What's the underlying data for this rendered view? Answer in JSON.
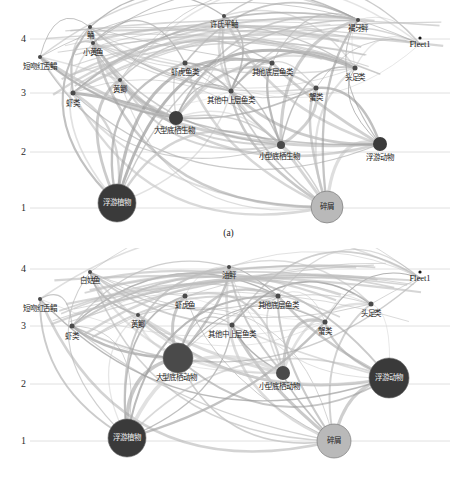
{
  "figure": {
    "type": "network-diagram",
    "panels": [
      {
        "id": "a",
        "caption": "(a)",
        "axis": {
          "label": "",
          "ticks": [
            "4",
            "3",
            "2",
            "1"
          ],
          "tick_y": [
            39,
            93,
            152,
            208
          ],
          "range": [
            1,
            4.6
          ]
        },
        "fleet": {
          "label": "Fleet1",
          "x": 420,
          "y": 44
        },
        "nodes": [
          {
            "name": "浮游植物",
            "x": 117,
            "y": 203,
            "r": 19,
            "color": "#3a3a3a",
            "label_color": "light",
            "trophic": 1.0
          },
          {
            "name": "碎屑",
            "x": 327,
            "y": 207,
            "r": 16,
            "color": "#b9b9b9",
            "label_color": "dark",
            "trophic": 1.0
          },
          {
            "name": "浮游动物",
            "x": 380,
            "y": 144,
            "r": 7,
            "color": "#3b3b3b",
            "label_color": "dark",
            "label_dx": 0,
            "label_dy": 14,
            "trophic": 2.1
          },
          {
            "name": "小型底栖生物",
            "x": 281,
            "y": 145,
            "r": 4,
            "color": "#4a4a4a",
            "label_color": "dark",
            "label_dx": -2,
            "label_dy": 12,
            "trophic": 2.1
          },
          {
            "name": "大型底栖生物",
            "x": 176,
            "y": 118,
            "r": 7,
            "color": "#3f3f3f",
            "label_color": "dark",
            "label_dx": -2,
            "label_dy": 13,
            "trophic": 2.55
          },
          {
            "name": "虾类",
            "x": 73,
            "y": 93,
            "r": 2.5,
            "color": "#4a4a4a",
            "label_color": "dark",
            "label_dx": 0,
            "label_dy": 11,
            "trophic": 3.0
          },
          {
            "name": "其他中上层鱼类",
            "x": 231,
            "y": 91,
            "r": 2.5,
            "color": "#4a4a4a",
            "label_color": "dark",
            "label_dx": 0,
            "label_dy": 10,
            "trophic": 3.02
          },
          {
            "name": "蟹类",
            "x": 316,
            "y": 88,
            "r": 2.5,
            "color": "#4a4a4a",
            "label_color": "dark",
            "label_dx": 0,
            "label_dy": 10,
            "trophic": 3.08
          },
          {
            "name": "黄鲫",
            "x": 120,
            "y": 80,
            "r": 2,
            "color": "#4a4a4a",
            "label_color": "dark",
            "label_dx": 0,
            "label_dy": 10,
            "trophic": 3.25
          },
          {
            "name": "头足类",
            "x": 355,
            "y": 68,
            "r": 2.5,
            "color": "#4a4a4a",
            "label_color": "dark",
            "label_dx": 0,
            "label_dy": 10,
            "trophic": 3.4
          },
          {
            "name": "虾虎鱼类",
            "x": 185,
            "y": 63,
            "r": 2.5,
            "color": "#4a4a4a",
            "label_color": "dark",
            "label_dx": 0,
            "label_dy": 10,
            "trophic": 3.5
          },
          {
            "name": "其他底层鱼类",
            "x": 272,
            "y": 63,
            "r": 2.5,
            "color": "#4a4a4a",
            "label_color": "dark",
            "label_dx": 0,
            "label_dy": 10,
            "trophic": 3.5
          },
          {
            "name": "短吻红舌鳎",
            "x": 40,
            "y": 57,
            "r": 2,
            "color": "#4a4a4a",
            "label_color": "dark",
            "label_dx": 0,
            "label_dy": 10,
            "trophic": 3.6
          },
          {
            "name": "小黄鱼",
            "x": 93,
            "y": 43,
            "r": 2,
            "color": "#4a4a4a",
            "label_color": "dark",
            "label_dx": 0,
            "label_dy": 10,
            "trophic": 3.8
          },
          {
            "name": "鲬",
            "x": 90,
            "y": 27,
            "r": 2,
            "color": "#4a4a4a",
            "label_color": "dark",
            "label_dx": 0,
            "label_dy": 9,
            "trophic": 4.05
          },
          {
            "name": "许氏平鲉",
            "x": 224,
            "y": 16,
            "r": 2,
            "color": "#4a4a4a",
            "label_color": "dark",
            "label_dx": 0,
            "label_dy": 9,
            "trophic": 4.3
          },
          {
            "name": "褐牙鲆",
            "x": 358,
            "y": 20,
            "r": 2,
            "color": "#4a4a4a",
            "label_color": "dark",
            "label_dx": 0,
            "label_dy": 9,
            "trophic": 4.25
          }
        ]
      },
      {
        "id": "b",
        "caption": "(b)",
        "axis": {
          "label": "",
          "ticks": [
            "4",
            "3",
            "2",
            "1"
          ],
          "tick_y": [
            21,
            78,
            136,
            193
          ],
          "range": [
            1,
            4.6
          ]
        },
        "fleet": {
          "label": "Fleet1",
          "x": 420,
          "y": 30
        },
        "nodes": [
          {
            "name": "浮游植物",
            "x": 127,
            "y": 190,
            "r": 19,
            "color": "#3a3a3a",
            "label_color": "light",
            "trophic": 1.0
          },
          {
            "name": "碎屑",
            "x": 334,
            "y": 193,
            "r": 17,
            "color": "#b9b9b9",
            "label_color": "dark",
            "trophic": 1.0
          },
          {
            "name": "浮游动物",
            "x": 389,
            "y": 130,
            "r": 20,
            "color": "#3a3a3a",
            "label_color": "light",
            "trophic": 2.1
          },
          {
            "name": "小型底栖动物",
            "x": 283,
            "y": 125,
            "r": 7,
            "color": "#4a4a4a",
            "label_color": "dark",
            "label_dx": -4,
            "label_dy": 14,
            "trophic": 2.25
          },
          {
            "name": "大型底栖动物",
            "x": 178,
            "y": 110,
            "r": 15,
            "color": "#4a4a4a",
            "label_color": "dark",
            "label_dx": -2,
            "label_dy": 20,
            "trophic": 2.55
          },
          {
            "name": "虾类",
            "x": 72,
            "y": 78,
            "r": 2.5,
            "color": "#4a4a4a",
            "label_color": "dark",
            "label_dx": 0,
            "label_dy": 11,
            "trophic": 3.0
          },
          {
            "name": "其他中上层鱼类",
            "x": 232,
            "y": 77,
            "r": 2.5,
            "color": "#4a4a4a",
            "label_color": "dark",
            "label_dx": 0,
            "label_dy": 10,
            "trophic": 3.02
          },
          {
            "name": "蟹类",
            "x": 325,
            "y": 74,
            "r": 2.5,
            "color": "#4a4a4a",
            "label_color": "dark",
            "label_dx": 0,
            "label_dy": 10,
            "trophic": 3.08
          },
          {
            "name": "黄鲫",
            "x": 138,
            "y": 67,
            "r": 2,
            "color": "#4a4a4a",
            "label_color": "dark",
            "label_dx": 0,
            "label_dy": 10,
            "trophic": 3.22
          },
          {
            "name": "头足类",
            "x": 371,
            "y": 56,
            "r": 2.5,
            "color": "#4a4a4a",
            "label_color": "dark",
            "label_dx": 0,
            "label_dy": 10,
            "trophic": 3.4
          },
          {
            "name": "虾虎鱼",
            "x": 185,
            "y": 48,
            "r": 2.5,
            "color": "#4a4a4a",
            "label_color": "dark",
            "label_dx": 0,
            "label_dy": 10,
            "trophic": 3.55
          },
          {
            "name": "其他底层鱼类",
            "x": 278,
            "y": 48,
            "r": 2.5,
            "color": "#4a4a4a",
            "label_color": "dark",
            "label_dx": 0,
            "label_dy": 10,
            "trophic": 3.55
          },
          {
            "name": "短吻红舌鳎",
            "x": 40,
            "y": 51,
            "r": 2,
            "color": "#4a4a4a",
            "label_color": "dark",
            "label_dx": 0,
            "label_dy": 10,
            "trophic": 3.5
          },
          {
            "name": "白姑鱼",
            "x": 90,
            "y": 24,
            "r": 2,
            "color": "#4a4a4a",
            "label_color": "dark",
            "label_dx": 0,
            "label_dy": 9,
            "trophic": 4.05
          },
          {
            "name": "油鲆",
            "x": 229,
            "y": 19,
            "r": 2,
            "color": "#4a4a4a",
            "label_color": "dark",
            "label_dx": 0,
            "label_dy": 9,
            "trophic": 4.2
          }
        ]
      }
    ]
  }
}
